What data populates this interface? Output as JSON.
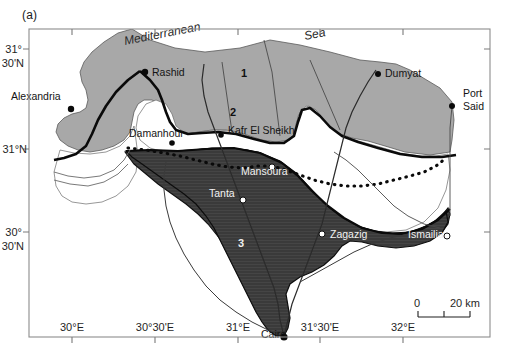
{
  "figure": {
    "panel_label": "(a)",
    "type": "map",
    "background_color": "#ffffff",
    "frame_color": "#8c8c8c"
  },
  "map": {
    "region": "Nile Delta, Egypt",
    "water_labels": [
      {
        "text": "Mediterranean",
        "x": 125,
        "y": 45,
        "rotate": -11
      },
      {
        "text": "Sea",
        "x": 305,
        "y": 40,
        "rotate": -11
      }
    ],
    "region_numbers": [
      {
        "text": "1",
        "x": 241,
        "y": 77,
        "style": "dark"
      },
      {
        "text": "2",
        "x": 230,
        "y": 116,
        "style": "dark"
      },
      {
        "text": "3",
        "x": 238,
        "y": 247,
        "style": "light"
      }
    ],
    "cities": [
      {
        "name": "Rashid",
        "label_x": 152,
        "label_y": 76,
        "dot_x": 145,
        "dot_y": 72,
        "dot": "filled",
        "style": "dark",
        "anchor": "start"
      },
      {
        "name": "Alexandria",
        "label_x": 11,
        "label_y": 100,
        "dot_x": 71,
        "dot_y": 109,
        "dot": "filled",
        "style": "dark",
        "anchor": "start"
      },
      {
        "name": "Damanhour",
        "label_x": 129,
        "label_y": 137,
        "dot_x": 172,
        "dot_y": 143,
        "dot": "filled",
        "style": "dark",
        "anchor": "start"
      },
      {
        "name": "Kafr El Sheikh",
        "label_x": 228,
        "label_y": 134,
        "dot_x": 221,
        "dot_y": 135,
        "dot": "filled",
        "style": "dark",
        "anchor": "start"
      },
      {
        "name": "Dumyat",
        "label_x": 385,
        "label_y": 77,
        "dot_x": 378,
        "dot_y": 74,
        "dot": "filled",
        "style": "dark",
        "anchor": "start"
      },
      {
        "name": "Port",
        "label_x": 463,
        "label_y": 97,
        "dot_x": 452,
        "dot_y": 106,
        "dot": "filled",
        "style": "dark",
        "anchor": "start"
      },
      {
        "name": "Said",
        "label_x": 463,
        "label_y": 110,
        "dot_x": null,
        "dot_y": null,
        "dot": "none",
        "style": "dark",
        "anchor": "start"
      },
      {
        "name": "Mansoura",
        "label_x": 241,
        "label_y": 175,
        "dot_x": 272,
        "dot_y": 167,
        "dot": "open",
        "style": "light",
        "anchor": "start"
      },
      {
        "name": "Tanta",
        "label_x": 209,
        "label_y": 197,
        "dot_x": 243,
        "dot_y": 200,
        "dot": "open",
        "style": "light",
        "anchor": "start"
      },
      {
        "name": "Zagazig",
        "label_x": 330,
        "label_y": 238,
        "dot_x": 322,
        "dot_y": 234,
        "dot": "open",
        "style": "light",
        "anchor": "start"
      },
      {
        "name": "Ismailia",
        "label_x": 408,
        "label_y": 238,
        "dot_x": 447,
        "dot_y": 236,
        "dot": "open",
        "style": "light",
        "anchor": "start"
      },
      {
        "name": "Cairo",
        "label_x": 261,
        "label_y": 338,
        "dot_x": 284,
        "dot_y": 337,
        "dot": "filled",
        "style": "dark",
        "anchor": "start"
      }
    ],
    "axes": {
      "x_ticks": [
        {
          "label": "30°E",
          "x": 72
        },
        {
          "label": "30°30'E",
          "x": 155
        },
        {
          "label": "31°E",
          "x": 238
        },
        {
          "label": "31°30'E",
          "x": 320
        },
        {
          "label": "32°E",
          "x": 403
        }
      ],
      "y_ticks": [
        {
          "label_line1": "31°",
          "label_line2": "30'N",
          "y": 53
        },
        {
          "label_line1": "31°N",
          "label_line2": "",
          "y": 149
        },
        {
          "label_line1": "30°",
          "label_line2": "30'N",
          "y": 236
        }
      ]
    },
    "scale_bar": {
      "zero_label": "0",
      "max_label": "20 km",
      "x_start": 420,
      "x_end": 470,
      "y": 312
    }
  }
}
